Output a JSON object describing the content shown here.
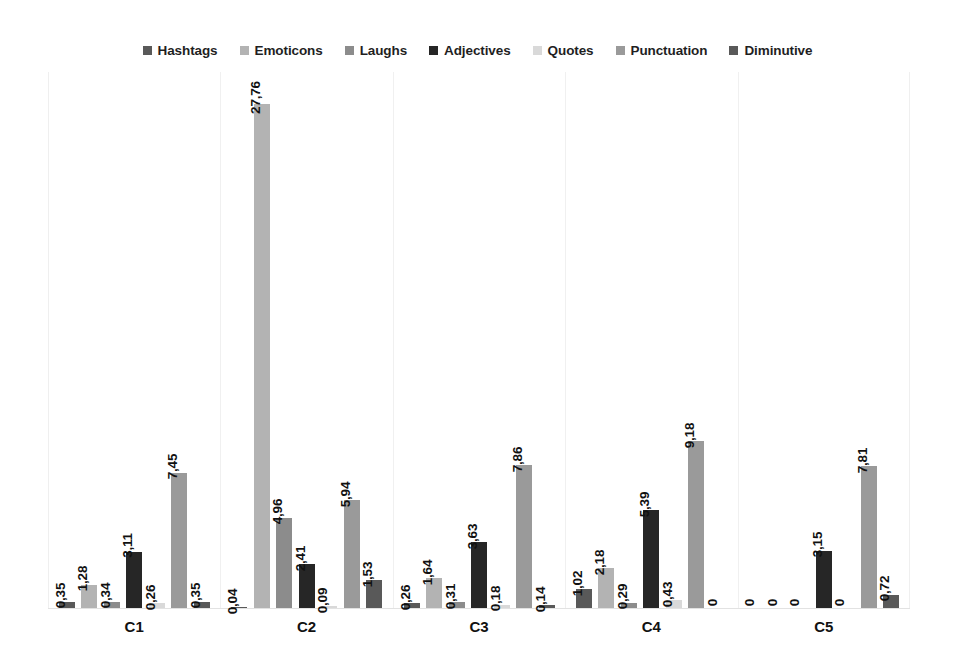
{
  "chart_data": {
    "type": "bar",
    "title": "",
    "subtitle": "",
    "xlabel": "",
    "ylabel": "",
    "grid": false,
    "legend_position": "top",
    "categories": [
      "C1",
      "C2",
      "C3",
      "C4",
      "C5"
    ],
    "ylim": [
      0,
      29.5
    ],
    "value_format": "comma-decimal",
    "series": [
      {
        "name": "Hashtags",
        "color": "#595959",
        "values": [
          0.35,
          0.04,
          0.26,
          1.02,
          0
        ],
        "labels": [
          "0,35",
          "0,04",
          "0,26",
          "1,02",
          "0"
        ]
      },
      {
        "name": "Emoticons",
        "color": "#b3b3b3",
        "values": [
          1.28,
          27.76,
          1.64,
          2.18,
          0
        ],
        "labels": [
          "1,28",
          "27,76",
          "1,64",
          "2,18",
          "0"
        ]
      },
      {
        "name": "Laughs",
        "color": "#8c8c8c",
        "values": [
          0.34,
          4.96,
          0.31,
          0.29,
          0
        ],
        "labels": [
          "0,34",
          "4,96",
          "0,31",
          "0,29",
          "0"
        ]
      },
      {
        "name": "Adjectives",
        "color": "#262626",
        "values": [
          3.11,
          2.41,
          3.63,
          5.39,
          3.15
        ],
        "labels": [
          "3,11",
          "2,41",
          "3,63",
          "5,39",
          "3,15"
        ]
      },
      {
        "name": "Quotes",
        "color": "#d9d9d9",
        "values": [
          0.26,
          0.09,
          0.18,
          0.43,
          0
        ],
        "labels": [
          "0,26",
          "0,09",
          "0,18",
          "0,43",
          "0"
        ]
      },
      {
        "name": "Punctuation",
        "color": "#9a9a9a",
        "values": [
          7.45,
          5.94,
          7.86,
          9.18,
          7.81
        ],
        "labels": [
          "7,45",
          "5,94",
          "7,86",
          "9,18",
          "7,81"
        ]
      },
      {
        "name": "Diminutive",
        "color": "#595959",
        "values": [
          0.35,
          1.53,
          0.14,
          0,
          0.72
        ],
        "labels": [
          "0,35",
          "1,53",
          "0,14",
          "0",
          "0,72"
        ]
      }
    ]
  },
  "legend": {
    "items": [
      {
        "label": "Hashtags",
        "color": "#595959"
      },
      {
        "label": "Emoticons",
        "color": "#b3b3b3"
      },
      {
        "label": "Laughs",
        "color": "#8c8c8c"
      },
      {
        "label": "Adjectives",
        "color": "#262626"
      },
      {
        "label": "Quotes",
        "color": "#d9d9d9"
      },
      {
        "label": "Punctuation",
        "color": "#9a9a9a"
      },
      {
        "label": "Diminutive",
        "color": "#595959"
      }
    ]
  }
}
